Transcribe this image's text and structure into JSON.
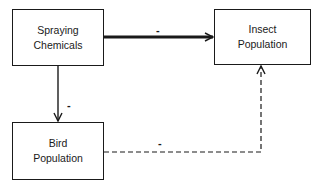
{
  "diagram": {
    "nodes": [
      {
        "id": "spraying",
        "line1": "Spraying",
        "line2": "Chemicals"
      },
      {
        "id": "insect",
        "line1": "Insect",
        "line2": "Population"
      },
      {
        "id": "bird",
        "line1": "Bird",
        "line2": "Population"
      }
    ],
    "edges": [
      {
        "from": "spraying",
        "to": "insect",
        "sign": "-",
        "style": "solid-thick"
      },
      {
        "from": "spraying",
        "to": "bird",
        "sign": "-",
        "style": "solid"
      },
      {
        "from": "bird",
        "to": "insect",
        "sign": "-",
        "style": "dashed"
      }
    ]
  }
}
